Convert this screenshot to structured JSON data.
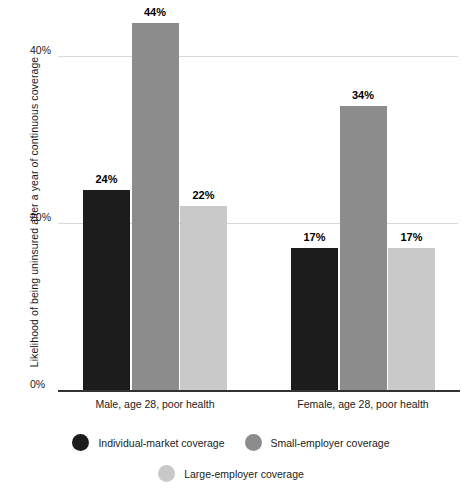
{
  "chart_data": {
    "type": "bar",
    "title": "",
    "subtitle": "",
    "xlabel": "",
    "ylabel": "Likelihood of being uninsured after a year of continuous coverage",
    "categories": [
      "Male, age 28, poor health",
      "Female, age 28, poor health"
    ],
    "series": [
      {
        "name": "Individual-market coverage",
        "color": "#1c1c1c",
        "values": [
          24,
          17
        ],
        "labels": [
          "24%",
          "17%"
        ]
      },
      {
        "name": "Small-employer coverage",
        "color": "#8c8c8c",
        "values": [
          44,
          34
        ],
        "labels": [
          "44%",
          "34%"
        ]
      },
      {
        "name": "Large-employer coverage",
        "color": "#c9c9c9",
        "values": [
          22,
          17
        ],
        "labels": [
          "22%",
          "17%"
        ]
      }
    ],
    "ylim": [
      0,
      48
    ],
    "yticks": [
      0,
      20,
      40
    ],
    "ytick_labels": [
      "0%",
      "20%",
      "40%"
    ],
    "grid": true,
    "legend_position": "bottom",
    "value_label_format": "percent"
  },
  "axis": {
    "y_title": "Likelihood of being uninsured after a year of continuous coverage",
    "ticks": [
      {
        "label": "40%",
        "value": 40
      },
      {
        "label": "20%",
        "value": 20
      },
      {
        "label": "0%",
        "value": 0
      }
    ]
  },
  "categories": [
    {
      "label": "Male, age 28, poor health"
    },
    {
      "label": "Female, age 28, poor health"
    }
  ],
  "bars": [
    {
      "group": 0,
      "series": 0,
      "label": "24%",
      "value": 24,
      "color": "#1c1c1c"
    },
    {
      "group": 0,
      "series": 1,
      "label": "44%",
      "value": 44,
      "color": "#8c8c8c"
    },
    {
      "group": 0,
      "series": 2,
      "label": "22%",
      "value": 22,
      "color": "#c9c9c9"
    },
    {
      "group": 1,
      "series": 0,
      "label": "17%",
      "value": 17,
      "color": "#1c1c1c"
    },
    {
      "group": 1,
      "series": 1,
      "label": "34%",
      "value": 34,
      "color": "#8c8c8c"
    },
    {
      "group": 1,
      "series": 2,
      "label": "17%",
      "value": 17,
      "color": "#c9c9c9"
    }
  ],
  "legend": {
    "items": [
      {
        "label": "Individual-market coverage",
        "color": "#1c1c1c"
      },
      {
        "label": "Small-employer coverage",
        "color": "#8c8c8c"
      },
      {
        "label": "Large-employer coverage",
        "color": "#c9c9c9"
      }
    ]
  },
  "colors": {
    "individual_market": "#1c1c1c",
    "small_employer": "#8c8c8c",
    "large_employer": "#c9c9c9",
    "gridline": "#d8d8d8",
    "axis": "#333333",
    "text": "#1a1a1a",
    "background": "#ffffff"
  }
}
